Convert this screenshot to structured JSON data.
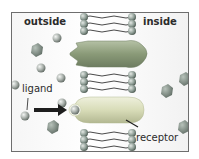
{
  "diagram": {
    "labels": {
      "outside": "outside",
      "inside": "inside",
      "ligand": "ligand",
      "receptor": "receptor"
    },
    "colors": {
      "frame_border": "#6e6e6e",
      "background": "#ffffff",
      "membrane_head": "#8f9e96",
      "membrane_tail": "#4a4a4a",
      "channel_protein": "#8a9a78",
      "receptor_protein": "#d8dcb8",
      "ligand_sphere": "#a9b0ab",
      "hexagon_molecule": "#7b877f",
      "arrow": "#1e1e1e"
    },
    "elements": {
      "membrane": "lipid bilayer",
      "top_protein": "channel protein",
      "bottom_protein": "receptor",
      "arrow": "ligand moving to receptor"
    }
  }
}
